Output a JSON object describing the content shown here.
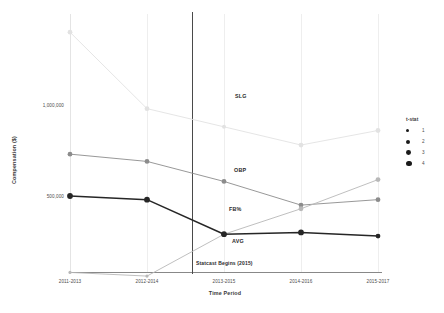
{
  "chart_data": {
    "type": "line",
    "title": "",
    "xlabel": "Time Period",
    "ylabel": "Compensation ($)",
    "categories": [
      "2011-2013",
      "2012-2014",
      "2013-2015",
      "2014-2016",
      "2015-2017"
    ],
    "ylim": [
      0,
      1500000
    ],
    "yticks": [
      500000,
      1000000
    ],
    "ytick_labels": [
      "500,000",
      "1,000,000"
    ],
    "grid": "vertical-only",
    "legend": {
      "title": "t-stat",
      "position": "right",
      "entries": [
        {
          "label": "1",
          "size": 3.2
        },
        {
          "label": "2",
          "size": 4.0
        },
        {
          "label": "3",
          "size": 4.8
        },
        {
          "label": "4",
          "size": 5.8
        }
      ]
    },
    "annotations": [
      {
        "name": "statcast-marker",
        "text": "Statcast Begins (2015)",
        "x_category": "2013-2015"
      }
    ],
    "series": [
      {
        "name": "SLG",
        "color": "#e2e2e2",
        "label": "SLG",
        "values": [
          1400000,
          980000,
          880000,
          780000,
          860000
        ],
        "tstat": [
          3,
          3,
          2,
          3,
          3
        ]
      },
      {
        "name": "OBP",
        "color": "#8c8c8c",
        "label": "OBP",
        "values": [
          730000,
          690000,
          580000,
          450000,
          480000
        ],
        "tstat": [
          3,
          3,
          3,
          3,
          3
        ]
      },
      {
        "name": "FB%",
        "color": "#b8b8b8",
        "label": "FB%",
        "values": [
          80000,
          60000,
          290000,
          430000,
          590000
        ],
        "tstat": [
          1,
          1,
          2,
          3,
          3
        ]
      },
      {
        "name": "AVG",
        "color": "#262626",
        "label": "AVG",
        "values": [
          500000,
          480000,
          290000,
          300000,
          280000
        ],
        "tstat": [
          4,
          4,
          4,
          4,
          3
        ]
      }
    ]
  }
}
